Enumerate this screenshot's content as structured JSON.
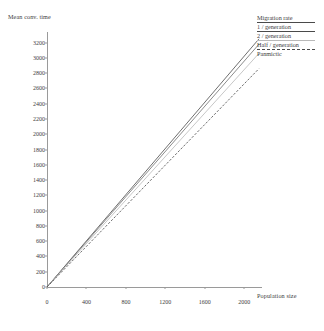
{
  "chart_data": {
    "type": "line",
    "title": "",
    "xlabel": "Population size",
    "ylabel": "Mean conv. time",
    "xlim": [
      0,
      2150
    ],
    "ylim": [
      0,
      3300
    ],
    "grid": false,
    "legend_position": "top-right",
    "legend_title": "Migration rate",
    "xticks": [
      0,
      400,
      800,
      1200,
      1600,
      2000
    ],
    "xtick_labels": [
      "0",
      "400",
      "800",
      "1200",
      "1600",
      "2000"
    ],
    "yticks": [
      0,
      200,
      400,
      600,
      800,
      1000,
      1200,
      1400,
      1600,
      1800,
      2000,
      2200,
      2400,
      2600,
      2800,
      3000,
      3200
    ],
    "ytick_labels": [
      "0",
      "200",
      "400",
      "600",
      "800",
      "1000",
      "1200",
      "1400",
      "1600",
      "1800",
      "2000",
      "2200",
      "2400",
      "2600",
      "2800",
      "3000",
      "3200"
    ],
    "x": [
      0,
      2150
    ],
    "series": [
      {
        "name": "1 / generation",
        "style": "solid",
        "color": "#4a4a4a",
        "values": [
          0,
          3250
        ]
      },
      {
        "name": "2 / generation",
        "style": "solid",
        "color": "#6e6e6e",
        "values": [
          0,
          3180
        ]
      },
      {
        "name": "Half / generation",
        "style": "solid",
        "color": "#b9b9b9",
        "values": [
          0,
          3060
        ]
      },
      {
        "name": "Panmictic",
        "style": "dashed",
        "color": "#4a4a4a",
        "values": [
          0,
          2860
        ]
      }
    ]
  },
  "axes": {
    "y_label": "Mean conv. time",
    "x_label": "Population size"
  },
  "legend": {
    "title": "Migration rate",
    "entries": [
      {
        "label": "1 / generation"
      },
      {
        "label": "2 / generation"
      },
      {
        "label": "Half / generation"
      },
      {
        "label": "Panmictic"
      }
    ]
  },
  "colors": {
    "axis": "#9a9a9a",
    "text": "#3d3d3d",
    "line_dark": "#4a4a4a",
    "line_mid": "#6e6e6e",
    "line_light": "#b9b9b9"
  }
}
